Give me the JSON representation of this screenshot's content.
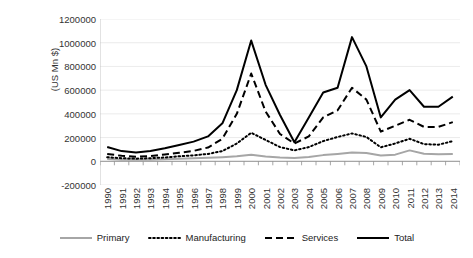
{
  "chart_data": {
    "type": "line",
    "title": "",
    "xlabel": "",
    "ylabel": "(US Mn $)",
    "ylim": [
      -200000,
      1200000
    ],
    "ytick_values": [
      1200000,
      1000000,
      800000,
      600000,
      400000,
      200000,
      0,
      -200000
    ],
    "ytick_labels": [
      "1200000",
      "1000000",
      "800000",
      "600000",
      "400000",
      "200000",
      "0",
      "-200000"
    ],
    "grid": true,
    "legend_position": "bottom",
    "categories": [
      "1990",
      "1991",
      "1992",
      "1993",
      "1994",
      "1995",
      "1996",
      "1997",
      "1998",
      "1999",
      "2000",
      "2001",
      "2002",
      "2003",
      "2004",
      "2005",
      "2006",
      "2007",
      "2008",
      "2009",
      "2010",
      "2011",
      "2012",
      "2013",
      "2014"
    ],
    "series": [
      {
        "name": "Primary",
        "style": "solid",
        "color": "#A6A6A6",
        "values": [
          20000,
          14000,
          12000,
          14000,
          18000,
          22000,
          26000,
          30000,
          35000,
          42000,
          55000,
          40000,
          32000,
          28000,
          36000,
          52000,
          62000,
          74000,
          70000,
          48000,
          56000,
          92000,
          64000,
          60000,
          62000
        ]
      },
      {
        "name": "Manufacturing",
        "style": "dotted",
        "color": "#000000",
        "values": [
          34000,
          26000,
          22000,
          26000,
          32000,
          42000,
          50000,
          62000,
          86000,
          150000,
          240000,
          180000,
          120000,
          92000,
          120000,
          170000,
          205000,
          235000,
          205000,
          118000,
          150000,
          190000,
          145000,
          140000,
          170000
        ]
      },
      {
        "name": "Services",
        "style": "dashed",
        "color": "#000000",
        "values": [
          62000,
          46000,
          38000,
          44000,
          58000,
          72000,
          88000,
          116000,
          190000,
          400000,
          740000,
          420000,
          230000,
          150000,
          210000,
          370000,
          430000,
          620000,
          520000,
          250000,
          300000,
          350000,
          290000,
          290000,
          330000
        ]
      },
      {
        "name": "Total",
        "style": "solid",
        "color": "#000000",
        "values": [
          120000,
          86000,
          74000,
          86000,
          110000,
          138000,
          166000,
          210000,
          320000,
          600000,
          1018000,
          645000,
          390000,
          160000,
          370000,
          580000,
          620000,
          1047000,
          800000,
          370000,
          520000,
          600000,
          460000,
          460000,
          545000
        ]
      }
    ]
  },
  "legend": {
    "items": [
      {
        "label": "Primary",
        "swatch": "line-solid-gray-swatch"
      },
      {
        "label": "Manufacturing",
        "swatch": "line-dotted-black-swatch"
      },
      {
        "label": "Services",
        "swatch": "line-dashed-black-swatch"
      },
      {
        "label": "Total",
        "swatch": "line-solid-black-swatch"
      }
    ]
  }
}
